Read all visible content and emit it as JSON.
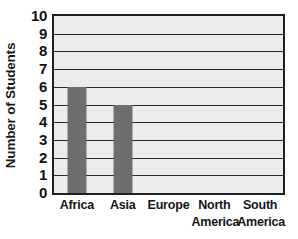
{
  "chart_data": {
    "type": "bar",
    "title": "",
    "xlabel": "",
    "ylabel": "Number of Students",
    "categories": [
      "Africa",
      "Asia",
      "Europe",
      "North America",
      "South America"
    ],
    "values": [
      6,
      5,
      0,
      0,
      0
    ],
    "ylim": [
      0,
      10
    ],
    "ytick_labels": [
      "10",
      "9",
      "8",
      "7",
      "6",
      "5",
      "4",
      "3",
      "2",
      "1",
      "0"
    ],
    "yticks": [
      10,
      9,
      8,
      7,
      6,
      5,
      4,
      3,
      2,
      1,
      0
    ],
    "grid": true,
    "legend": "none",
    "bar_color": "#6e6e6e",
    "plot_background": "#ececec",
    "axis_color": "#1f1f1f",
    "gridline_color": "#2a2a2a",
    "text_color": "#151515"
  },
  "axis": {
    "y_title": "Number of Students"
  },
  "x_labels": [
    {
      "line1": "Africa",
      "line2": ""
    },
    {
      "line1": "Asia",
      "line2": ""
    },
    {
      "line1": "Europe",
      "line2": ""
    },
    {
      "line1": "North",
      "line2": "America"
    },
    {
      "line1": "South",
      "line2": "America"
    }
  ]
}
